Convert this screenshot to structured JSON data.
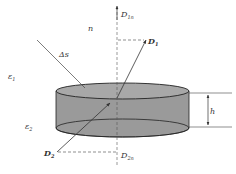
{
  "diagram": {
    "labels": {
      "D1n": "D",
      "D1n_sub": "1n",
      "n": "n",
      "D1": "D",
      "D1_sub": "1",
      "delta_s": "Δs",
      "eps1": "ε",
      "eps1_sub": "1",
      "eps2": "ε",
      "eps2_sub": "2",
      "h": "h",
      "D2": "D",
      "D2_sub": "2",
      "D2n": "D",
      "D2n_sub": "2n"
    },
    "colors": {
      "cylinder_fill": "#9a9a9a",
      "cylinder_top_fill": "#a8a8a8",
      "stroke": "#333333",
      "background": "#ffffff"
    }
  }
}
